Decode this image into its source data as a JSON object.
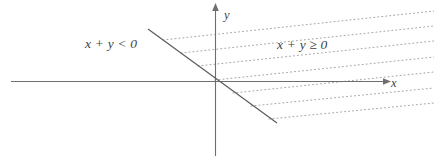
{
  "figure": {
    "width": 434,
    "height": 156,
    "background_color": "#ffffff"
  },
  "axes": {
    "x_axis": {
      "label": "x",
      "label_x": 391,
      "label_y": 77,
      "x_start": 11,
      "x_end": 386,
      "y": 81.5,
      "color": "#6e6e6e",
      "arrow": "right"
    },
    "y_axis": {
      "label": "y",
      "label_x": 224,
      "label_y": 9,
      "x": 215.5,
      "y_start": 8,
      "y_end": 156,
      "color": "#6e6e6e",
      "arrow": "up"
    },
    "origin": {
      "x": 215.5,
      "y": 81.5
    }
  },
  "boundary_line": {
    "equation": "x + y = 0",
    "style": "solid",
    "color": "#5a5a5a",
    "x1": 148,
    "y1": 29,
    "x2": 277,
    "y2": 123
  },
  "hatching": {
    "style": "dotted",
    "color": "#9a9a9a",
    "dash_pattern": "1 3",
    "line_count": 7,
    "description": "dotted rays filling the region x + y >= 0",
    "lines": [
      {
        "x1": 163,
        "y1": 40,
        "x2": 434,
        "y2": 11
      },
      {
        "x1": 181,
        "y1": 53,
        "x2": 434,
        "y2": 26
      },
      {
        "x1": 198,
        "y1": 66,
        "x2": 434,
        "y2": 41
      },
      {
        "x1": 215,
        "y1": 80,
        "x2": 434,
        "y2": 57
      },
      {
        "x1": 233,
        "y1": 93,
        "x2": 434,
        "y2": 72
      },
      {
        "x1": 251,
        "y1": 106,
        "x2": 434,
        "y2": 88
      },
      {
        "x1": 269,
        "y1": 119,
        "x2": 434,
        "y2": 103
      }
    ]
  },
  "region_labels": [
    {
      "id": "negative-half-plane",
      "text": "x + y < 0",
      "x": 85,
      "y": 37,
      "color": "#3f3f3f"
    },
    {
      "id": "positive-half-plane",
      "text": "x + y ≥ 0",
      "x": 277,
      "y": 38,
      "color": "#3f3f3f"
    }
  ]
}
